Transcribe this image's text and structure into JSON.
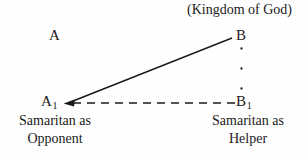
{
  "figure": {
    "top_caption": "(Kingdom of God)",
    "vertices": {
      "a": {
        "letter": "A",
        "subscript": ""
      },
      "b": {
        "letter": "B",
        "subscript": ""
      },
      "a1": {
        "letter": "A",
        "subscript": "1"
      },
      "b1": {
        "letter": "B",
        "subscript": "1"
      }
    },
    "captions": {
      "opponent_line1": "Samaritan as",
      "opponent_line2": "Opponent",
      "helper_line1": "Samaritan as",
      "helper_line2": "Helper"
    },
    "colors": {
      "ink": "#1a1a1a",
      "background": "#fefefe"
    }
  }
}
